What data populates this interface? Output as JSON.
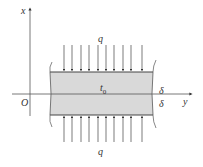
{
  "diagram": {
    "axes": {
      "x_label": "x",
      "y_label": "y",
      "origin_label": "O"
    },
    "slab": {
      "center_label": "t",
      "center_subscript": "0",
      "half_thickness_top": "δ",
      "half_thickness_bottom": "δ",
      "fill_color": "#d9d9d9",
      "edge_color": "#444444"
    },
    "heat_flux": {
      "top_label": "q",
      "bottom_label": "q",
      "arrow_count_top": 10,
      "arrow_count_bottom": 10
    }
  }
}
